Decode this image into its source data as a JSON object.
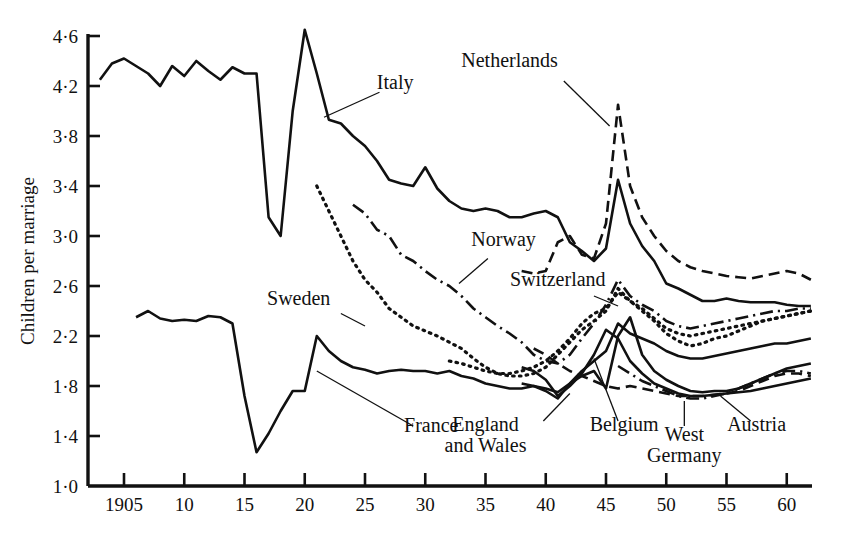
{
  "chart_data": {
    "type": "line",
    "title": "",
    "xlabel": "",
    "ylabel": "Children per marriage",
    "xlim": [
      1903,
      1962
    ],
    "ylim": [
      1.0,
      4.6
    ],
    "grid": false,
    "legend": "inline-annotations",
    "x_ticks": [
      "1905",
      "10",
      "15",
      "20",
      "25",
      "30",
      "35",
      "40",
      "45",
      "50",
      "55",
      "60"
    ],
    "x_tick_values": [
      1905,
      1910,
      1915,
      1920,
      1925,
      1930,
      1935,
      1940,
      1945,
      1950,
      1955,
      1960
    ],
    "y_ticks": [
      "1·0",
      "1·4",
      "1·8",
      "2·2",
      "2·6",
      "3·0",
      "3·4",
      "3·8",
      "4·2",
      "4·6"
    ],
    "y_tick_values": [
      1.0,
      1.4,
      1.8,
      2.2,
      2.6,
      3.0,
      3.4,
      3.8,
      4.2,
      4.6
    ],
    "series": [
      {
        "name": "Italy",
        "style": "solid",
        "label_x": 1927.5,
        "label_y": 4.18,
        "leader": [
          [
            1926.2,
            4.15
          ],
          [
            1921.6,
            3.95
          ]
        ],
        "x": [
          1903,
          1904,
          1905,
          1906,
          1907,
          1908,
          1909,
          1910,
          1911,
          1912,
          1913,
          1914,
          1915,
          1916,
          1917,
          1918,
          1919,
          1920,
          1921,
          1922,
          1923,
          1924,
          1925,
          1926,
          1927,
          1928,
          1929,
          1930,
          1931,
          1932,
          1933,
          1934,
          1935,
          1936,
          1937,
          1938,
          1939,
          1940,
          1941,
          1942,
          1943,
          1944,
          1945,
          1946,
          1947,
          1948,
          1949,
          1950,
          1951,
          1952,
          1953,
          1954,
          1955,
          1956,
          1957,
          1958,
          1959,
          1960,
          1961,
          1962
        ],
        "y": [
          4.25,
          4.38,
          4.42,
          4.36,
          4.3,
          4.2,
          4.36,
          4.28,
          4.4,
          4.32,
          4.25,
          4.35,
          4.3,
          4.3,
          3.15,
          3.0,
          4.0,
          4.65,
          4.3,
          3.93,
          3.9,
          3.8,
          3.72,
          3.6,
          3.45,
          3.42,
          3.4,
          3.55,
          3.38,
          3.28,
          3.22,
          3.2,
          3.22,
          3.2,
          3.15,
          3.15,
          3.18,
          3.2,
          3.15,
          2.95,
          2.88,
          2.8,
          2.9,
          3.45,
          3.1,
          2.92,
          2.8,
          2.62,
          2.58,
          2.53,
          2.48,
          2.48,
          2.5,
          2.48,
          2.47,
          2.47,
          2.47,
          2.45,
          2.44,
          2.44
        ]
      },
      {
        "name": "Netherlands",
        "style": "dashed",
        "label_x": 1937.0,
        "label_y": 4.35,
        "leader": [
          [
            1941.5,
            4.24
          ],
          [
            1945.3,
            3.88
          ]
        ],
        "x": [
          1938,
          1939,
          1940,
          1941,
          1942,
          1943,
          1944,
          1945,
          1946,
          1947,
          1948,
          1949,
          1950,
          1951,
          1952,
          1953,
          1954,
          1955,
          1956,
          1957,
          1958,
          1959,
          1960,
          1961,
          1962
        ],
        "y": [
          2.72,
          2.7,
          2.72,
          2.95,
          3.0,
          2.85,
          2.82,
          3.1,
          4.05,
          3.4,
          3.15,
          3.0,
          2.88,
          2.8,
          2.75,
          2.72,
          2.7,
          2.68,
          2.67,
          2.66,
          2.68,
          2.7,
          2.72,
          2.7,
          2.65
        ]
      },
      {
        "name": "Norway",
        "style": "dashdot",
        "label_x": 1936.5,
        "label_y": 2.92,
        "leader": [
          [
            1935.2,
            2.82
          ],
          [
            1932.8,
            2.62
          ]
        ],
        "x": [
          1924,
          1925,
          1926,
          1927,
          1928,
          1929,
          1930,
          1931,
          1932,
          1933,
          1934,
          1935,
          1936,
          1937,
          1938,
          1939,
          1940,
          1941,
          1942,
          1943,
          1944,
          1945,
          1946,
          1947,
          1948,
          1949,
          1950,
          1951,
          1952,
          1953,
          1954,
          1955,
          1956,
          1957,
          1958,
          1959,
          1960,
          1961,
          1962
        ],
        "y": [
          3.25,
          3.18,
          3.05,
          3.0,
          2.85,
          2.8,
          2.72,
          2.65,
          2.6,
          2.52,
          2.42,
          2.35,
          2.28,
          2.22,
          2.15,
          2.05,
          2.0,
          1.98,
          2.05,
          2.18,
          2.3,
          2.45,
          2.65,
          2.52,
          2.45,
          2.4,
          2.32,
          2.28,
          2.26,
          2.28,
          2.3,
          2.32,
          2.34,
          2.36,
          2.38,
          2.4,
          2.4,
          2.42,
          2.42
        ]
      },
      {
        "name": "Sweden",
        "style": "dotted",
        "label_x": 1919.5,
        "label_y": 2.45,
        "leader": [
          [
            1923.0,
            2.38
          ],
          [
            1925.0,
            2.28
          ]
        ],
        "x": [
          1921,
          1922,
          1923,
          1924,
          1925,
          1926,
          1927,
          1928,
          1929,
          1930,
          1931,
          1932,
          1933,
          1934,
          1935,
          1936,
          1937,
          1938,
          1939,
          1940,
          1941,
          1942,
          1943,
          1944,
          1945,
          1946,
          1947,
          1948,
          1949,
          1950,
          1951,
          1952,
          1953,
          1954,
          1955,
          1956,
          1957,
          1958,
          1959,
          1960,
          1961,
          1962
        ],
        "y": [
          3.4,
          3.2,
          3.0,
          2.8,
          2.65,
          2.55,
          2.42,
          2.35,
          2.28,
          2.24,
          2.2,
          2.15,
          2.1,
          2.02,
          1.95,
          1.9,
          1.88,
          1.88,
          1.9,
          1.95,
          2.05,
          2.15,
          2.25,
          2.32,
          2.4,
          2.58,
          2.48,
          2.4,
          2.32,
          2.22,
          2.16,
          2.12,
          2.14,
          2.18,
          2.2,
          2.24,
          2.28,
          2.32,
          2.34,
          2.36,
          2.38,
          2.4
        ]
      },
      {
        "name": "Switzerland",
        "style": "dotted",
        "label_x": 1941.0,
        "label_y": 2.6,
        "leader": [
          [
            1944.0,
            2.52
          ],
          [
            1946.0,
            2.44
          ]
        ],
        "x": [
          1932,
          1933,
          1934,
          1935,
          1936,
          1937,
          1938,
          1939,
          1940,
          1941,
          1942,
          1943,
          1944,
          1945,
          1946,
          1947,
          1948,
          1949,
          1950,
          1951,
          1952,
          1953,
          1954,
          1955,
          1956,
          1957,
          1958,
          1959,
          1960,
          1961,
          1962
        ],
        "y": [
          2.0,
          1.98,
          1.95,
          1.92,
          1.9,
          1.9,
          1.92,
          1.95,
          2.0,
          2.08,
          2.18,
          2.3,
          2.38,
          2.42,
          2.55,
          2.48,
          2.42,
          2.34,
          2.26,
          2.22,
          2.2,
          2.22,
          2.24,
          2.26,
          2.28,
          2.3,
          2.32,
          2.34,
          2.36,
          2.38,
          2.4
        ]
      },
      {
        "name": "France",
        "style": "solid",
        "label_x": 1930.5,
        "label_y": 1.43,
        "leader": [
          [
            1929.0,
            1.48
          ],
          [
            1921.0,
            1.92
          ]
        ],
        "x": [
          1906,
          1907,
          1908,
          1909,
          1910,
          1911,
          1912,
          1913,
          1914,
          1915,
          1916,
          1917,
          1918,
          1919,
          1920,
          1921,
          1922,
          1923,
          1924,
          1925,
          1926,
          1927,
          1928,
          1929,
          1930,
          1931,
          1932,
          1933,
          1934,
          1935,
          1936,
          1937,
          1938,
          1939,
          1940,
          1941,
          1942,
          1943,
          1944,
          1945,
          1946,
          1947,
          1948,
          1949,
          1950,
          1951,
          1952,
          1953,
          1954,
          1955,
          1956,
          1957,
          1958,
          1959,
          1960,
          1961,
          1962
        ],
        "y": [
          2.35,
          2.4,
          2.34,
          2.32,
          2.33,
          2.32,
          2.36,
          2.35,
          2.3,
          1.72,
          1.27,
          1.42,
          1.6,
          1.76,
          1.76,
          2.2,
          2.08,
          2.0,
          1.95,
          1.93,
          1.9,
          1.92,
          1.93,
          1.92,
          1.92,
          1.9,
          1.92,
          1.88,
          1.86,
          1.82,
          1.8,
          1.78,
          1.78,
          1.8,
          1.78,
          1.75,
          1.82,
          1.92,
          2.0,
          2.08,
          2.3,
          2.22,
          2.18,
          2.14,
          2.08,
          2.04,
          2.02,
          2.02,
          2.04,
          2.06,
          2.08,
          2.1,
          2.12,
          2.14,
          2.14,
          2.16,
          2.18
        ]
      },
      {
        "name": "England and Wales",
        "style": "solid",
        "label_x": 1935.0,
        "label_y": 1.44,
        "label_line2": "and Wales",
        "leader": [
          [
            1939.8,
            1.52
          ],
          [
            1942.0,
            1.74
          ]
        ],
        "x": [
          1938,
          1939,
          1940,
          1941,
          1942,
          1943,
          1944,
          1945,
          1946,
          1947,
          1948,
          1949,
          1950,
          1951,
          1952,
          1953,
          1954,
          1955,
          1956,
          1957,
          1958,
          1959,
          1960,
          1961,
          1962
        ],
        "y": [
          1.82,
          1.8,
          1.76,
          1.7,
          1.82,
          1.88,
          1.92,
          1.78,
          2.2,
          2.35,
          2.05,
          1.92,
          1.85,
          1.8,
          1.76,
          1.75,
          1.76,
          1.76,
          1.78,
          1.82,
          1.86,
          1.9,
          1.94,
          1.96,
          1.98
        ]
      },
      {
        "name": "Belgium",
        "style": "solid",
        "label_x": 1946.5,
        "label_y": 1.44,
        "leader": [
          [
            1946.0,
            1.52
          ],
          [
            1944.0,
            2.02
          ]
        ],
        "x": [
          1938,
          1939,
          1940,
          1941,
          1942,
          1943,
          1944,
          1945,
          1946,
          1947,
          1948,
          1949,
          1950,
          1951,
          1952,
          1953,
          1954,
          1955,
          1956,
          1957,
          1958,
          1959,
          1960,
          1961,
          1962
        ],
        "y": [
          1.95,
          1.92,
          1.85,
          1.72,
          1.8,
          1.9,
          2.05,
          2.25,
          2.18,
          2.0,
          1.9,
          1.82,
          1.78,
          1.74,
          1.72,
          1.72,
          1.73,
          1.74,
          1.75,
          1.76,
          1.78,
          1.8,
          1.82,
          1.84,
          1.86
        ]
      },
      {
        "name": "West Germany",
        "style": "dashed",
        "label_x": 1951.5,
        "label_y": 1.36,
        "label_line2": "Germany",
        "leader": [
          [
            1951.5,
            1.48
          ],
          [
            1951.5,
            1.68
          ]
        ],
        "x": [
          1939,
          1940,
          1941,
          1942,
          1943,
          1944,
          1945,
          1946,
          1947,
          1948,
          1949,
          1950,
          1951,
          1952,
          1953,
          1954,
          1955,
          1956,
          1957,
          1958,
          1959,
          1960,
          1961,
          1962
        ],
        "y": [
          2.1,
          2.05,
          1.98,
          1.92,
          1.88,
          1.84,
          1.8,
          1.78,
          1.8,
          1.78,
          1.76,
          1.74,
          1.72,
          1.72,
          1.72,
          1.73,
          1.74,
          1.76,
          1.8,
          1.84,
          1.88,
          1.9,
          1.9,
          1.88
        ]
      },
      {
        "name": "Austria",
        "style": "dashdot",
        "label_x": 1957.5,
        "label_y": 1.44,
        "leader": [
          [
            1957.0,
            1.52
          ],
          [
            1954.5,
            1.72
          ]
        ],
        "x": [
          1946,
          1947,
          1948,
          1949,
          1950,
          1951,
          1952,
          1953,
          1954,
          1955,
          1956,
          1957,
          1958,
          1959,
          1960,
          1961,
          1962
        ],
        "y": [
          1.96,
          1.9,
          1.84,
          1.8,
          1.76,
          1.72,
          1.7,
          1.7,
          1.72,
          1.74,
          1.78,
          1.82,
          1.86,
          1.9,
          1.92,
          1.92,
          1.9
        ]
      }
    ],
    "annotations": [
      "Italy",
      "Netherlands",
      "Norway",
      "Sweden",
      "Switzerland",
      "France",
      "England and Wales",
      "Belgium",
      "West Germany",
      "Austria"
    ]
  },
  "colors": {
    "ink": "#111111",
    "background": "#ffffff"
  }
}
